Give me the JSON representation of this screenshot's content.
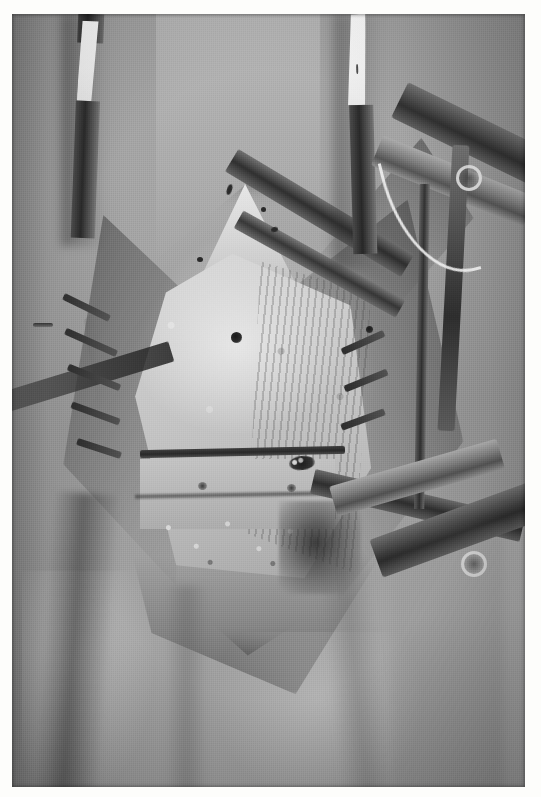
{
  "image": {
    "kind": "photograph",
    "subject": "intraoperative-surgical-field",
    "description": "Black-and-white intraoperative photograph of an open knee/leg surgical exposure",
    "color_mode": "grayscale",
    "border": {
      "style": "white photographic print margin",
      "color": "#ffffff",
      "left_px": 12,
      "top_px": 14,
      "right_px": 16,
      "bottom_px": 10
    },
    "canvas": {
      "width": 541,
      "height": 797
    },
    "photo_area": {
      "x": 12,
      "y": 14,
      "width": 513,
      "height": 773
    },
    "palette": {
      "skin_midtone": "#9a9a98",
      "skin_highlight": "#d7d5ce",
      "drape_shadow": "#3a3a38",
      "bone_bright": "#e8e6df",
      "bone_mid": "#c6c4bc",
      "instrument_dark": "#262624",
      "instrument_highlight": "#ebe9e2",
      "tape_white": "#fbfbf8",
      "drill_hole_black": "#141413"
    }
  },
  "scene": {
    "regions": [
      {
        "name": "upper-limb-skin",
        "tone": "mid-gray",
        "note": "vertical thigh shading with two fixation pins entering"
      },
      {
        "name": "surgical-wound",
        "tone": "bright",
        "note": "diamond-shaped open exposure in the center"
      },
      {
        "name": "exposed-bone-graft",
        "tone": "brightest",
        "note": "triangular pale bone surface with drill holes"
      },
      {
        "name": "lower-drape",
        "tone": "mid-gray with folds",
        "note": "cloth folds across the lower third"
      }
    ]
  },
  "elements": {
    "pin_left": {
      "label": "fixation pin with white tape, upper left",
      "tape_color": "#fbfbf8"
    },
    "pin_right": {
      "label": "fixation pin with white tape, upper right",
      "tape_color": "#fbfbf8"
    },
    "retractor_arms": {
      "label": "self-retaining retractor frame arms, right side",
      "count": 4
    },
    "retractor_rings": {
      "label": "instrument finger rings",
      "count": 2
    },
    "retractor_blade": {
      "label": "retractor blade crossing the wound diagonally"
    },
    "suture_teeth": {
      "label": "row of dark sutures / retractor teeth along the left wound margin",
      "count": 5
    },
    "drill_holes": {
      "label": "dark drill holes in the exposed bone",
      "count": 2
    },
    "bone_plate_bar": {
      "label": "dark horizontal bar / osteotomy line across the lower graft"
    },
    "blood_clot": {
      "label": "dark clot area at the lower graft margin"
    }
  },
  "caption": ""
}
